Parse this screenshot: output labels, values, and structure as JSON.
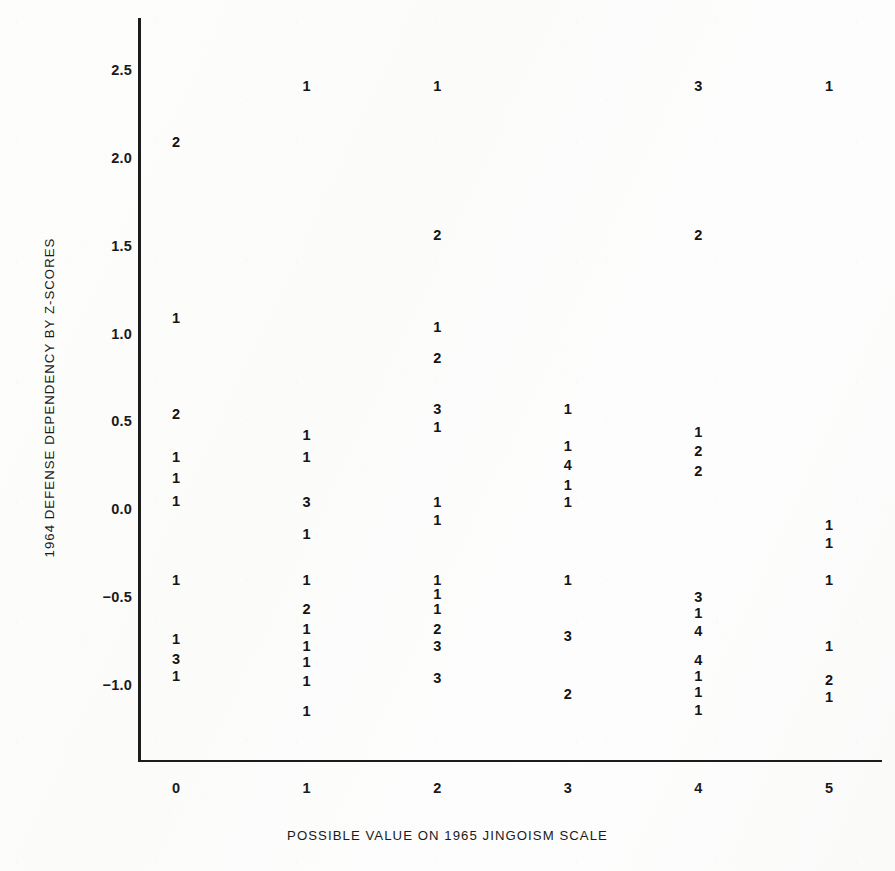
{
  "figure": {
    "x_axis_title": "POSSIBLE VALUE ON 1965 JINGOISM SCALE",
    "y_axis_title": "1964 DEFENSE DEPENDENCY BY Z-SCORES",
    "ink_color": "#1a1a1a",
    "paper_color": "#fdfdfc"
  },
  "chart_data": {
    "type": "scatter",
    "title": "",
    "subtitle": "",
    "xlabel": "POSSIBLE VALUE ON 1965 JINGOISM SCALE",
    "ylabel": "1964 DEFENSE DEPENDENCY BY Z-SCORES",
    "xlim": [
      -0.35,
      5.45
    ],
    "ylim": [
      -1.28,
      2.72
    ],
    "xticks": [
      0,
      1,
      2,
      3,
      4,
      5
    ],
    "xtick_labels": [
      "0",
      "1",
      "2",
      "3",
      "4",
      "5"
    ],
    "yticks": [
      2.5,
      2.0,
      1.5,
      1.0,
      0.5,
      0.0,
      -0.5,
      -1.0
    ],
    "ytick_labels": [
      "2.5",
      "2.0",
      "1.5",
      "1.0",
      "0.5",
      "0.0",
      "-0.5",
      "-1.0"
    ],
    "grid": false,
    "legend": null,
    "marker_encoding": "printed digit = number of cases stacked at that coordinate",
    "points": [
      {
        "x": 0,
        "y": 2.09,
        "count": "2"
      },
      {
        "x": 0,
        "y": 1.09,
        "count": "1"
      },
      {
        "x": 0,
        "y": 0.54,
        "count": "2"
      },
      {
        "x": 0,
        "y": 0.3,
        "count": "1"
      },
      {
        "x": 0,
        "y": 0.18,
        "count": "1"
      },
      {
        "x": 0,
        "y": 0.05,
        "count": "1"
      },
      {
        "x": 0,
        "y": -0.4,
        "count": "1"
      },
      {
        "x": 0,
        "y": -0.74,
        "count": "1"
      },
      {
        "x": 0,
        "y": -0.85,
        "count": "3"
      },
      {
        "x": 0,
        "y": -0.95,
        "count": "1"
      },
      {
        "x": 1,
        "y": 2.41,
        "count": "1"
      },
      {
        "x": 1,
        "y": 0.42,
        "count": "1"
      },
      {
        "x": 1,
        "y": 0.3,
        "count": "1"
      },
      {
        "x": 1,
        "y": 0.04,
        "count": "3"
      },
      {
        "x": 1,
        "y": -0.14,
        "count": "1"
      },
      {
        "x": 1,
        "y": -0.4,
        "count": "1"
      },
      {
        "x": 1,
        "y": -0.57,
        "count": "2"
      },
      {
        "x": 1,
        "y": -0.68,
        "count": "1"
      },
      {
        "x": 1,
        "y": -0.78,
        "count": "1"
      },
      {
        "x": 1,
        "y": -0.87,
        "count": "1"
      },
      {
        "x": 1,
        "y": -0.98,
        "count": "1"
      },
      {
        "x": 1,
        "y": -1.15,
        "count": "1"
      },
      {
        "x": 2,
        "y": 2.41,
        "count": "1"
      },
      {
        "x": 2,
        "y": 1.56,
        "count": "2"
      },
      {
        "x": 2,
        "y": 1.04,
        "count": "1"
      },
      {
        "x": 2,
        "y": 0.86,
        "count": "2"
      },
      {
        "x": 2,
        "y": 0.57,
        "count": "3"
      },
      {
        "x": 2,
        "y": 0.47,
        "count": "1"
      },
      {
        "x": 2,
        "y": 0.04,
        "count": "1"
      },
      {
        "x": 2,
        "y": -0.06,
        "count": "1"
      },
      {
        "x": 2,
        "y": -0.4,
        "count": "1"
      },
      {
        "x": 2,
        "y": -0.48,
        "count": "1"
      },
      {
        "x": 2,
        "y": -0.57,
        "count": "1"
      },
      {
        "x": 2,
        "y": -0.68,
        "count": "2"
      },
      {
        "x": 2,
        "y": -0.78,
        "count": "3"
      },
      {
        "x": 2,
        "y": -0.96,
        "count": "3"
      },
      {
        "x": 3,
        "y": 0.57,
        "count": "1"
      },
      {
        "x": 3,
        "y": 0.36,
        "count": "1"
      },
      {
        "x": 3,
        "y": 0.25,
        "count": "4"
      },
      {
        "x": 3,
        "y": 0.14,
        "count": "1"
      },
      {
        "x": 3,
        "y": 0.04,
        "count": "1"
      },
      {
        "x": 3,
        "y": -0.4,
        "count": "1"
      },
      {
        "x": 3,
        "y": -0.72,
        "count": "3"
      },
      {
        "x": 3,
        "y": -1.05,
        "count": "2"
      },
      {
        "x": 4,
        "y": 2.41,
        "count": "3"
      },
      {
        "x": 4,
        "y": 1.56,
        "count": "2"
      },
      {
        "x": 4,
        "y": 0.44,
        "count": "1"
      },
      {
        "x": 4,
        "y": 0.33,
        "count": "2"
      },
      {
        "x": 4,
        "y": 0.22,
        "count": "2"
      },
      {
        "x": 4,
        "y": -0.5,
        "count": "3"
      },
      {
        "x": 4,
        "y": -0.59,
        "count": "1"
      },
      {
        "x": 4,
        "y": -0.69,
        "count": "4"
      },
      {
        "x": 4,
        "y": -0.86,
        "count": "4"
      },
      {
        "x": 4,
        "y": -0.95,
        "count": "1"
      },
      {
        "x": 4,
        "y": -1.04,
        "count": "1"
      },
      {
        "x": 4,
        "y": -1.14,
        "count": "1"
      },
      {
        "x": 5,
        "y": 2.41,
        "count": "1"
      },
      {
        "x": 5,
        "y": -0.09,
        "count": "1"
      },
      {
        "x": 5,
        "y": -0.19,
        "count": "1"
      },
      {
        "x": 5,
        "y": -0.4,
        "count": "1"
      },
      {
        "x": 5,
        "y": -0.78,
        "count": "1"
      },
      {
        "x": 5,
        "y": -0.97,
        "count": "2"
      },
      {
        "x": 5,
        "y": -1.07,
        "count": "1"
      }
    ]
  }
}
